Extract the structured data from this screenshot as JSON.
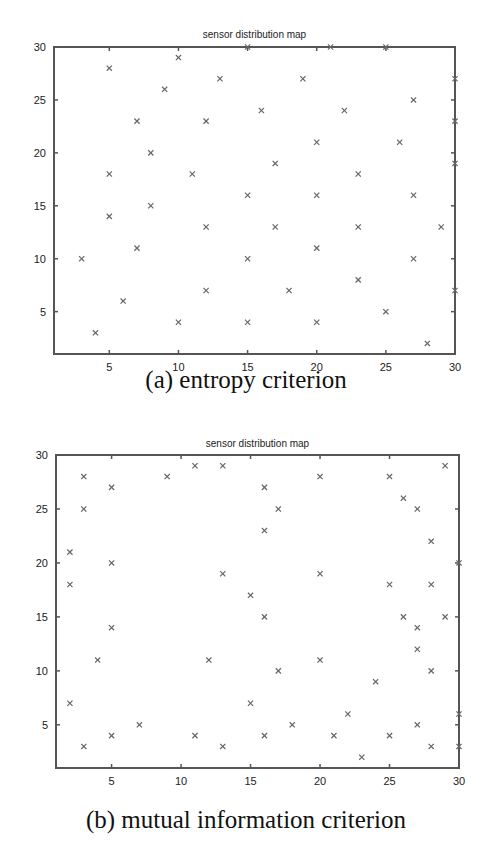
{
  "chart_data": [
    {
      "type": "scatter",
      "title": "sensor distribution map",
      "caption": "(a) entropy criterion",
      "xlabel": "",
      "ylabel": "",
      "xlim": [
        1,
        30
      ],
      "ylim": [
        1,
        30
      ],
      "xticks": [
        5,
        10,
        15,
        20,
        25,
        30
      ],
      "yticks": [
        5,
        10,
        15,
        20,
        25,
        30
      ],
      "grid": false,
      "marker": "x",
      "points": [
        [
          5,
          28
        ],
        [
          10,
          29
        ],
        [
          9,
          26
        ],
        [
          13,
          27
        ],
        [
          19,
          27
        ],
        [
          27,
          25
        ],
        [
          7,
          23
        ],
        [
          12,
          23
        ],
        [
          16,
          24
        ],
        [
          22,
          24
        ],
        [
          8,
          20
        ],
        [
          20,
          21
        ],
        [
          26,
          21
        ],
        [
          5,
          18
        ],
        [
          11,
          18
        ],
        [
          17,
          19
        ],
        [
          23,
          18
        ],
        [
          15,
          16
        ],
        [
          20,
          16
        ],
        [
          27,
          16
        ],
        [
          5,
          14
        ],
        [
          8,
          15
        ],
        [
          3,
          10
        ],
        [
          7,
          11
        ],
        [
          12,
          13
        ],
        [
          17,
          13
        ],
        [
          23,
          13
        ],
        [
          29,
          13
        ],
        [
          15,
          10
        ],
        [
          20,
          11
        ],
        [
          27,
          10
        ],
        [
          6,
          6
        ],
        [
          12,
          7
        ],
        [
          18,
          7
        ],
        [
          23,
          8
        ],
        [
          4,
          3
        ],
        [
          10,
          4
        ],
        [
          15,
          4
        ],
        [
          20,
          4
        ],
        [
          25,
          5
        ],
        [
          28,
          2
        ],
        [
          15,
          30
        ],
        [
          21,
          30
        ],
        [
          25,
          30
        ],
        [
          30,
          27
        ],
        [
          30,
          23
        ],
        [
          30,
          19
        ],
        [
          30,
          7
        ]
      ]
    },
    {
      "type": "scatter",
      "title": "sensor distribution map",
      "caption": "(b) mutual information criterion",
      "xlabel": "",
      "ylabel": "",
      "xlim": [
        1,
        30
      ],
      "ylim": [
        1,
        30
      ],
      "xticks": [
        5,
        10,
        15,
        20,
        25,
        30
      ],
      "yticks": [
        5,
        10,
        15,
        20,
        25,
        30
      ],
      "grid": false,
      "marker": "x",
      "points": [
        [
          3,
          28
        ],
        [
          9,
          28
        ],
        [
          11,
          29
        ],
        [
          13,
          29
        ],
        [
          20,
          28
        ],
        [
          25,
          28
        ],
        [
          29,
          29
        ],
        [
          5,
          27
        ],
        [
          16,
          27
        ],
        [
          26,
          26
        ],
        [
          3,
          25
        ],
        [
          17,
          25
        ],
        [
          27,
          25
        ],
        [
          16,
          23
        ],
        [
          28,
          22
        ],
        [
          2,
          21
        ],
        [
          5,
          20
        ],
        [
          13,
          19
        ],
        [
          20,
          19
        ],
        [
          30,
          20
        ],
        [
          2,
          18
        ],
        [
          25,
          18
        ],
        [
          28,
          18
        ],
        [
          15,
          17
        ],
        [
          16,
          15
        ],
        [
          26,
          15
        ],
        [
          29,
          15
        ],
        [
          5,
          14
        ],
        [
          27,
          14
        ],
        [
          27,
          12
        ],
        [
          4,
          11
        ],
        [
          12,
          11
        ],
        [
          20,
          11
        ],
        [
          17,
          10
        ],
        [
          28,
          10
        ],
        [
          24,
          9
        ],
        [
          2,
          7
        ],
        [
          15,
          7
        ],
        [
          22,
          6
        ],
        [
          30,
          6
        ],
        [
          7,
          5
        ],
        [
          18,
          5
        ],
        [
          27,
          5
        ],
        [
          5,
          4
        ],
        [
          11,
          4
        ],
        [
          16,
          4
        ],
        [
          21,
          4
        ],
        [
          25,
          4
        ],
        [
          3,
          3
        ],
        [
          13,
          3
        ],
        [
          28,
          3
        ],
        [
          30,
          3
        ],
        [
          23,
          2
        ]
      ]
    }
  ],
  "panels": [
    {
      "title": "sensor distribution map",
      "caption": "(a) entropy criterion"
    },
    {
      "title": "sensor distribution map",
      "caption": "(b) mutual information criterion"
    }
  ]
}
